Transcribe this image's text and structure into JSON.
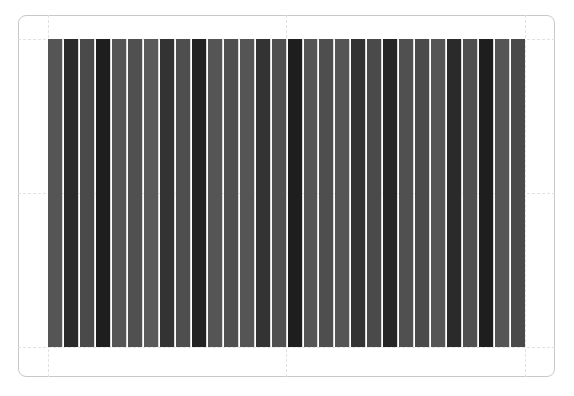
{
  "chart_data": {
    "type": "bar",
    "title": "",
    "xlabel": "",
    "ylabel": "",
    "grid": true,
    "legend": "none",
    "ylim": [
      0,
      1
    ],
    "categories": [
      "1",
      "2",
      "3",
      "4",
      "5",
      "6",
      "7",
      "8",
      "9",
      "10",
      "11",
      "12",
      "13",
      "14",
      "15",
      "16",
      "17",
      "18",
      "19",
      "20",
      "21",
      "22",
      "23",
      "24",
      "25",
      "26",
      "27",
      "28",
      "29",
      "30"
    ],
    "values": [
      1,
      1,
      1,
      1,
      1,
      1,
      1,
      1,
      1,
      1,
      1,
      1,
      1,
      1,
      1,
      1,
      1,
      1,
      1,
      1,
      1,
      1,
      1,
      1,
      1,
      1,
      1,
      1,
      1,
      1
    ],
    "colors": [
      "#555555",
      "#2a2a2a",
      "#4a4a4a",
      "#1e1e1e",
      "#555555",
      "#505050",
      "#5a5a5a",
      "#333333",
      "#4e4e4e",
      "#222222",
      "#555555",
      "#505050",
      "#555555",
      "#333333",
      "#505050",
      "#1e1e1e",
      "#555555",
      "#4e4e4e",
      "#555555",
      "#333333",
      "#4a4a4a",
      "#252525",
      "#505050",
      "#4a4a4a",
      "#555555",
      "#2a2a2a",
      "#505050",
      "#1e1e1e",
      "#555555",
      "#4a4a4a"
    ]
  }
}
